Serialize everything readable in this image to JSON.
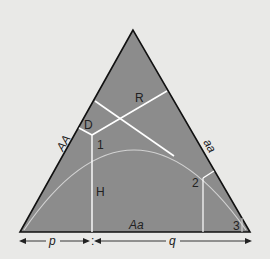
{
  "diagram": {
    "vertex_labels": {
      "left_side": "AA",
      "right_side": "aa",
      "base": "Aa"
    },
    "regions": {
      "R": "R",
      "D": "D",
      "H": "H"
    },
    "points": [
      "1",
      "2",
      "3"
    ],
    "axis": {
      "p": "p",
      "q": "q"
    },
    "colors": {
      "fill": "#8c8c8c",
      "background": "#e9e9e7",
      "lines": "#ffffff",
      "curve": "#d0d0d0",
      "edge": "#111111"
    }
  }
}
